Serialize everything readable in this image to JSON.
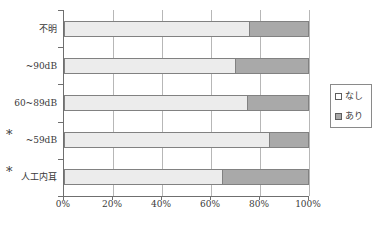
{
  "figure": {
    "background": "#ffffff",
    "axis_color": "#6f6f6f",
    "gridline_color": "#b7b7b7",
    "text_color": "#3a3a3a"
  },
  "chart_data": {
    "type": "bar",
    "orientation": "horizontal",
    "stacked": true,
    "unit": "%",
    "title": "",
    "categories": [
      "不明",
      "~90dB",
      "60~89dB",
      "~59dB",
      "人工内耳"
    ],
    "category_flags": [
      "",
      "",
      "",
      "*",
      "*"
    ],
    "series": [
      {
        "name": "なし",
        "values": [
          76,
          70,
          75,
          84,
          65
        ],
        "color": "#ececec",
        "swatch": "light"
      },
      {
        "name": "あり",
        "values": [
          24,
          30,
          25,
          16,
          35
        ],
        "color": "#a9a9a9",
        "swatch": "dark"
      }
    ],
    "x_ticks": [
      "0%",
      "20%",
      "40%",
      "60%",
      "80%",
      "100%"
    ],
    "xlim": [
      0,
      100
    ],
    "grid": true,
    "legend": {
      "position": "right",
      "border": true
    }
  }
}
